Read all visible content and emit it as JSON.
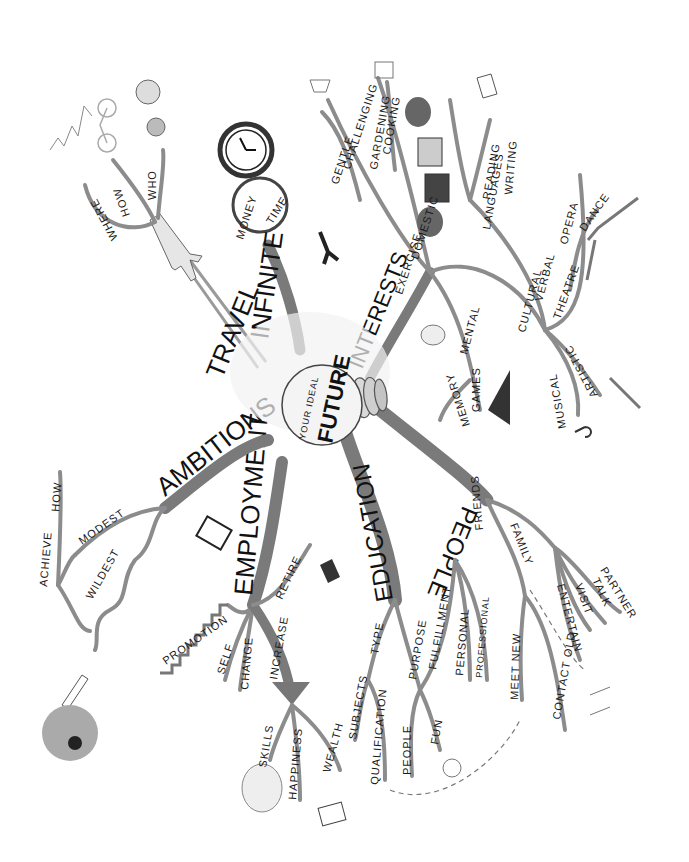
{
  "center": {
    "line1": "YOUR IDEAL",
    "line2": "FUTURE"
  },
  "branches": {
    "travel": {
      "label": "TRAVEL",
      "children": [
        "WHERE",
        "HOW",
        "WHO"
      ]
    },
    "infinite": {
      "label": "INFINITE",
      "children": [
        "MONEY",
        "TIME"
      ]
    },
    "interests": {
      "label": "INTERESTS",
      "exercise": {
        "label": "EXERCISE",
        "children": [
          "GENTLE",
          "CHALLENGING"
        ]
      },
      "domestic": {
        "label": "DOMESTIC",
        "children": [
          "GARDENING",
          "COOKING"
        ]
      },
      "mental": {
        "label": "MENTAL",
        "children": [
          "MEMORY",
          "GAMES"
        ]
      },
      "cultural": {
        "label": "CULTURAL",
        "verbal": {
          "label": "VERBAL",
          "children": [
            "LANGUAGES",
            "READING",
            "WRITING"
          ]
        },
        "theatre": {
          "label": "THEATRE",
          "children": [
            "OPERA",
            "DANCE"
          ]
        },
        "musical": "MUSICAL",
        "artistic": "ARTISTIC"
      }
    },
    "people": {
      "label": "PEOPLE",
      "friends": {
        "label": "FRIENDS",
        "children": [
          "MEET NEW",
          "CONTACT OLD"
        ]
      },
      "family": {
        "label": "FAMILY",
        "children": [
          "ENTERTAIN",
          "VISIT",
          "TALK",
          "PARTNER"
        ]
      }
    },
    "education": {
      "label": "EDUCATION",
      "type": {
        "label": "TYPE",
        "children": [
          "SUBJECTS",
          "QUALIFICATION"
        ]
      },
      "purpose": {
        "label": "PURPOSE",
        "children": [
          "PEOPLE",
          "FUN"
        ]
      },
      "fulfillment": {
        "label": "FULFILLMENT",
        "children": [
          "PERSONAL",
          "PROFESSIONAL"
        ]
      }
    },
    "employment": {
      "label": "EMPLOYMENT",
      "children": [
        "PROMOTION",
        "SELF",
        "CHANGE",
        "INCREASE",
        "RETIRE"
      ],
      "increase_children": [
        "SKILLS",
        "HAPPINESS",
        "WEALTH"
      ]
    },
    "ambitions": {
      "label": "AMBITIONS",
      "children": [
        "MODEST",
        "WILDEST"
      ],
      "modest_children": [
        "ACHIEVE",
        "HOW"
      ]
    }
  },
  "icons": [
    "plane-icon",
    "bicycle-icon",
    "mountains-icon",
    "people-icon",
    "clock-icon",
    "magnifier-icon",
    "walking-legs-icon",
    "trowel-icon",
    "cake-icon",
    "heads-speaking-icon",
    "flag-icon",
    "book-icon",
    "dancer-icon",
    "brain-icon",
    "chess-board-icon",
    "paintbrush-icon",
    "music-note-icon",
    "smiley-icon",
    "glasses-icon",
    "briefcase-icon",
    "stairs-icon",
    "baby-icon",
    "money-hand-icon",
    "rocket-icon",
    "explosion-icon",
    "grad-book-icon"
  ],
  "colors": {
    "branch": "#7a7a7a",
    "ink": "#111111",
    "background": "#ffffff"
  }
}
